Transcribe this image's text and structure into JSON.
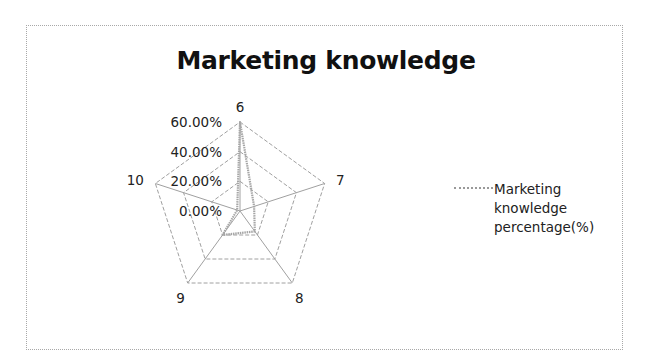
{
  "chart_data": {
    "type": "radar",
    "title": "Marketing knowledge",
    "categories": [
      "6",
      "7",
      "8",
      "9",
      "10"
    ],
    "series": [
      {
        "name": "Marketing knowledge percentage(%)",
        "values": [
          60,
          10,
          17,
          20,
          2
        ],
        "color": "#a6a6a6"
      }
    ],
    "radial_ticks": [
      "0.00%",
      "20.00%",
      "40.00%",
      "60.00%"
    ],
    "rlim": [
      0,
      60
    ],
    "grid": true,
    "legend_position": "right"
  },
  "legend": {
    "label_lines": [
      "Marketing",
      "knowledge",
      "percentage(%)"
    ]
  }
}
